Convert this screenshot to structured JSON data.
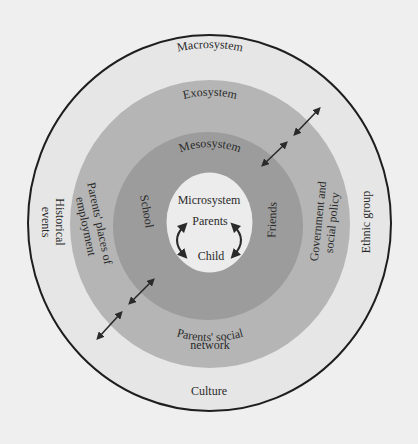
{
  "diagram": {
    "type": "concentric-systems",
    "colors": {
      "background": "#efefef",
      "macrosystem": "#e6e6e6",
      "exosystem": "#b5b5b5",
      "mesosystem": "#9c9c9c",
      "microsystem": "#ececec",
      "outline": "#1e1e1e",
      "text": "#2a2a2a",
      "arrow": "#2a2a2a"
    },
    "layers": {
      "macrosystem": {
        "title": "Macrosystem",
        "items": {
          "culture": "Culture",
          "historical_line1": "Historical",
          "historical_line2": "events",
          "ethnic_group": "Ethnic group"
        }
      },
      "exosystem": {
        "title": "Exosystem",
        "items": {
          "employment_line1": "Parents' places of",
          "employment_line2": "employment",
          "government_line1": "Government and",
          "government_line2": "social policy",
          "social_line1": "Parents' social",
          "social_line2": "network"
        }
      },
      "mesosystem": {
        "title": "Mesosystem",
        "items": {
          "school": "School",
          "friends": "Friends"
        }
      },
      "microsystem": {
        "title": "Microsystem",
        "items": {
          "parents": "Parents",
          "child": "Child"
        }
      }
    },
    "arrows": [
      {
        "name": "upper-right-outer",
        "from": [
          296,
          133
        ],
        "to": [
          318,
          110
        ]
      },
      {
        "name": "upper-right-inner",
        "from": [
          264,
          164
        ],
        "to": [
          285,
          144
        ]
      },
      {
        "name": "lower-left-inner",
        "from": [
          131,
          302
        ],
        "to": [
          152,
          281
        ]
      },
      {
        "name": "lower-left-outer",
        "from": [
          99,
          337
        ],
        "to": [
          120,
          314
        ]
      }
    ]
  }
}
